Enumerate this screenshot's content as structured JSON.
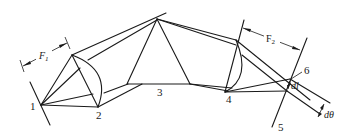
{
  "diagram": {
    "type": "optical schematic",
    "labels": {
      "p1": "1",
      "p2": "2",
      "p3": "3",
      "p4": "4",
      "p5": "5",
      "p6": "6",
      "f1_main": "F",
      "f1_sub": "1",
      "f2_main": "F",
      "f2_sub": "2",
      "dl": "dl",
      "dtheta": "dθ"
    },
    "components": [
      {
        "id": "1",
        "role": "source point / entrance slit"
      },
      {
        "id": "2",
        "role": "collimating lens (focal length F1)"
      },
      {
        "id": "3",
        "role": "dispersing prism"
      },
      {
        "id": "4",
        "role": "focusing lens (focal length F2)"
      },
      {
        "id": "5",
        "role": "focal plane"
      },
      {
        "id": "6",
        "role": "image point"
      }
    ],
    "dimensions": [
      {
        "name": "F1",
        "between": [
          "1",
          "2"
        ]
      },
      {
        "name": "F2",
        "between": [
          "4",
          "5"
        ]
      },
      {
        "name": "dl",
        "meaning": "linear separation on focal plane"
      },
      {
        "name": "dθ",
        "meaning": "angular separation"
      }
    ],
    "colors": {
      "ink": "#1a1a1a",
      "background": "#ffffff"
    }
  }
}
